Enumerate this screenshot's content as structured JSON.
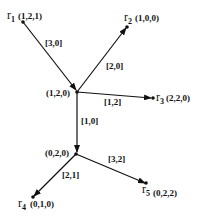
{
  "diagram": {
    "nodes": [
      {
        "id": "r1",
        "name": "r",
        "sub": "1",
        "coords": "(1,2,1)",
        "x": 23,
        "y": 22
      },
      {
        "id": "n1",
        "name": "",
        "sub": "",
        "coords": "(1,2,0)",
        "x": 77,
        "y": 92
      },
      {
        "id": "r2",
        "name": "r",
        "sub": "2",
        "coords": "(1,0,0)",
        "x": 127,
        "y": 27
      },
      {
        "id": "r3",
        "name": "r",
        "sub": "3",
        "coords": "(2,2,0)",
        "x": 153,
        "y": 98
      },
      {
        "id": "n2",
        "name": "",
        "sub": "",
        "coords": "(0,2,0)",
        "x": 76,
        "y": 154
      },
      {
        "id": "r4",
        "name": "r",
        "sub": "4",
        "coords": "(0,1,0)",
        "x": 33,
        "y": 197
      },
      {
        "id": "r5",
        "name": "r",
        "sub": "5",
        "coords": "(0,2,2)",
        "x": 146,
        "y": 183
      }
    ],
    "edges": [
      {
        "from": "r1",
        "to": "n1",
        "label": "[3,0]"
      },
      {
        "from": "n1",
        "to": "r2",
        "label": "[2,0]"
      },
      {
        "from": "n1",
        "to": "r3",
        "label": "[1,2]"
      },
      {
        "from": "n1",
        "to": "n2",
        "label": "[1,0]"
      },
      {
        "from": "n2",
        "to": "r4",
        "label": "[2,1]"
      },
      {
        "from": "n2",
        "to": "r5",
        "label": "[3,2]"
      }
    ],
    "text": {
      "r1_name": "r",
      "r1_sub": "1",
      "r1_coords": "(1,2,1)",
      "r2_name": "r",
      "r2_sub": "2",
      "r2_coords": "(1,0,0)",
      "r3_name": "r",
      "r3_sub": "3",
      "r3_coords": "(2,2,0)",
      "r4_name": "r",
      "r4_sub": "4",
      "r4_coords": "(0,1,0)",
      "r5_name": "r",
      "r5_sub": "5",
      "r5_coords": "(0,2,2)",
      "n1_coords": "(1,2,0)",
      "n2_coords": "(0,2,0)",
      "e_r1_n1": "[3,0]",
      "e_n1_r2": "[2,0]",
      "e_n1_r3": "[1,2]",
      "e_n1_n2": "[1,0]",
      "e_n2_r4": "[2,1]",
      "e_n2_r5": "[3,2]"
    },
    "colors": {
      "stroke": "#111111",
      "background": "#ffffff"
    }
  }
}
